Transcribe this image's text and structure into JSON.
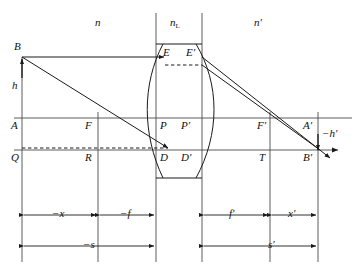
{
  "figure": {
    "type": "optics-ray-diagram",
    "background": "#ffffff",
    "stroke": "#1a1a1a"
  },
  "media_labels": [
    {
      "name": "object-space-index",
      "text": "n",
      "x": 97,
      "y": 23
    },
    {
      "name": "lens-index",
      "text": "n",
      "sub": "L",
      "x": 172,
      "y": 23
    },
    {
      "name": "image-space-index",
      "text": "n′",
      "x": 256,
      "y": 23
    }
  ],
  "points": [
    {
      "name": "point-B",
      "text": "B",
      "x": 14,
      "y": 43
    },
    {
      "name": "point-h",
      "text": "h",
      "x": 12,
      "y": 83
    },
    {
      "name": "point-A",
      "text": "A",
      "x": 12,
      "y": 121
    },
    {
      "name": "point-Q",
      "text": "Q",
      "x": 12,
      "y": 153
    },
    {
      "name": "point-F",
      "text": "F",
      "x": 85,
      "y": 121
    },
    {
      "name": "point-R",
      "text": "R",
      "x": 85,
      "y": 153
    },
    {
      "name": "point-E",
      "text": "E",
      "x": 163,
      "y": 50
    },
    {
      "name": "point-E-prime",
      "text": "E′",
      "x": 186,
      "y": 50
    },
    {
      "name": "point-P",
      "text": "P",
      "x": 160,
      "y": 121
    },
    {
      "name": "point-P-prime",
      "text": "P′",
      "x": 181,
      "y": 121
    },
    {
      "name": "point-D",
      "text": "D",
      "x": 160,
      "y": 153
    },
    {
      "name": "point-D-prime",
      "text": "D′",
      "x": 181,
      "y": 153
    },
    {
      "name": "point-F-prime",
      "text": "F′",
      "x": 257,
      "y": 121
    },
    {
      "name": "point-T",
      "text": "T",
      "x": 259,
      "y": 153
    },
    {
      "name": "point-A-prime",
      "text": "A′",
      "x": 305,
      "y": 121
    },
    {
      "name": "point-B-prime",
      "text": "B′",
      "x": 305,
      "y": 153
    },
    {
      "name": "image-height",
      "text": "−h′",
      "x": 324,
      "y": 131
    }
  ],
  "dimensions": {
    "row1": [
      {
        "name": "dim-minus-x",
        "text": "−x",
        "x": 57,
        "y": 212
      },
      {
        "name": "dim-minus-f",
        "text": "−f",
        "x": 125,
        "y": 212
      },
      {
        "name": "dim-f-prime",
        "text": "f′",
        "x": 231,
        "y": 212
      },
      {
        "name": "dim-x-prime",
        "text": "x′",
        "x": 292,
        "y": 212
      }
    ],
    "row2": [
      {
        "name": "dim-minus-s",
        "text": "−s",
        "x": 90,
        "y": 243
      },
      {
        "name": "dim-s-prime",
        "text": "s′",
        "x": 272,
        "y": 243
      }
    ]
  },
  "geometry": {
    "axis_y": 150,
    "secondary_axis_y": 118,
    "object_x": 22,
    "focal_left_x": 98,
    "lens_left_x": 156,
    "lens_right_x": 202,
    "focal_right_x": 270,
    "image_x": 318,
    "lens_top_y": 44,
    "lens_bottom_y": 178,
    "upper_ray_y": 65,
    "object_top_y": 57
  }
}
